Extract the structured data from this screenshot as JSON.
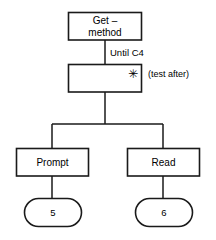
{
  "diagram": {
    "type": "structure-chart",
    "background_color": "#ffffff",
    "line_color": "#1a1a1a",
    "text_color": "#000000",
    "nodes": [
      {
        "id": "root",
        "shape": "rectangle",
        "label_line1": "Get –",
        "label_line2": "method"
      },
      {
        "id": "iteration",
        "shape": "rectangle",
        "label": "",
        "marker": "✳",
        "marker_name": "iteration-asterisk"
      },
      {
        "id": "prompt",
        "shape": "rectangle",
        "label": "Prompt"
      },
      {
        "id": "read",
        "shape": "rectangle",
        "label": "Read"
      },
      {
        "id": "node5",
        "shape": "stadium",
        "label": "5"
      },
      {
        "id": "node6",
        "shape": "stadium",
        "label": "6"
      }
    ],
    "edge_labels": [
      {
        "id": "until-condition",
        "text": "Until C4"
      }
    ],
    "annotations": [
      {
        "id": "test-position",
        "text": "(test after)"
      }
    ]
  }
}
